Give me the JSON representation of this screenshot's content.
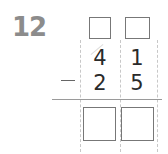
{
  "problem": {
    "number": "12",
    "operation": "subtraction",
    "operator_symbol": "−",
    "minuend": {
      "tens": "4",
      "ones": "1"
    },
    "subtrahend": {
      "tens": "2",
      "ones": "5"
    },
    "regroup_boxes": {
      "tens": "",
      "ones": ""
    },
    "answer_boxes": {
      "tens": "",
      "ones": ""
    }
  },
  "colors": {
    "number_label": "#8c8c8c",
    "digits": "#2a2a2a",
    "box_border": "#777777",
    "guide_lines": "#c8c8c8"
  }
}
